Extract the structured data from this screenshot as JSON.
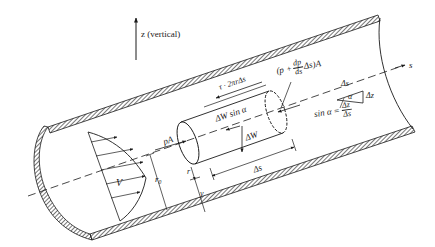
{
  "diagram": {
    "type": "inclined pipe flow free-body diagram",
    "axis_vertical_label": "z (vertical)",
    "axis_streamwise_label": "s",
    "labels": {
      "shear_force": "τ · 2πrΔs",
      "weight_component": "ΔW sin α",
      "weight": "ΔW",
      "pressure_force_upstream": "pA",
      "pressure_force_downstream_prefix": "(p +",
      "pressure_force_downstream_frac_num": "dp",
      "pressure_force_downstream_frac_den": "ds",
      "pressure_force_downstream_suffix": "Δs)A",
      "element_length": "Δs",
      "radius": "r",
      "distance_from_wall": "y",
      "pipe_radius": "r₀",
      "velocity": "V",
      "triangle_hyp": "Δs",
      "triangle_angle": "α",
      "triangle_rise": "Δz",
      "sin_prefix": "sin α =",
      "sin_num": "Δz",
      "sin_den": "Δs"
    },
    "colors": {
      "ink": "#1a1a1a",
      "background": "#ffffff"
    }
  }
}
